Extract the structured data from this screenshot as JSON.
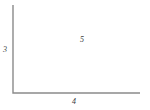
{
  "figure": {
    "kind": "right-triangle-diagram",
    "background_color": "#ffffff",
    "stroke_color": "#8a8a8a",
    "stroke_width": 1.4,
    "label_color": "#3a3a3a",
    "label_font_size_px": 8
  },
  "geometry": {
    "vertices": {
      "apex_top_left": {
        "x": 13,
        "y": 5
      },
      "right_angle_bottom_left": {
        "x": 13,
        "y": 93
      },
      "bottom_right": {
        "x": 140,
        "y": 93
      }
    },
    "polygon_points": "13,5 13,93 140,93"
  },
  "labels": {
    "vertical_leg": "3",
    "horizontal_leg": "4",
    "hypotenuse": "5"
  },
  "chart_data": {
    "type": "table",
    "title": "",
    "categories": [
      "vertical leg",
      "horizontal leg",
      "hypotenuse"
    ],
    "values": [
      3,
      4,
      5
    ],
    "xlabel": "",
    "ylabel": "",
    "annotations": [
      "3",
      "4",
      "5"
    ],
    "grid": false,
    "legend": "none"
  }
}
